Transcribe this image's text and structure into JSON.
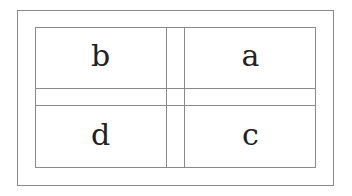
{
  "diagram": {
    "cells": [
      {
        "label": "b",
        "position": "top-left"
      },
      {
        "label": "a",
        "position": "top-right"
      },
      {
        "label": "d",
        "position": "bottom-left"
      },
      {
        "label": "c",
        "position": "bottom-right"
      }
    ],
    "line_color": "#8a8a8a"
  }
}
